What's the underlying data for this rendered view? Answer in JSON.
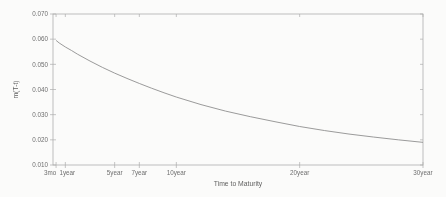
{
  "figure": {
    "background": "#fbfbfa",
    "appearance": "scanned grayscale plot"
  },
  "chart_data": {
    "type": "line",
    "title": "",
    "xlabel": "Time to Maturity",
    "ylabel": "m(T-t)",
    "xlim": [
      0,
      30
    ],
    "ylim": [
      0.01,
      0.07
    ],
    "grid": false,
    "legend": null,
    "axis_color": "#aeaeae",
    "text_color": "#6f6f6f",
    "x_ticks": [
      {
        "value": 0.25,
        "label": "3mo"
      },
      {
        "value": 1,
        "label": "1year"
      },
      {
        "value": 5,
        "label": "5year"
      },
      {
        "value": 7,
        "label": "7year"
      },
      {
        "value": 10,
        "label": "10year"
      },
      {
        "value": 20,
        "label": "20year"
      },
      {
        "value": 30,
        "label": "30year"
      }
    ],
    "y_ticks": [
      {
        "value": 0.01,
        "label": "0.010"
      },
      {
        "value": 0.02,
        "label": "0.020"
      },
      {
        "value": 0.03,
        "label": "0.030"
      },
      {
        "value": 0.04,
        "label": "0.040"
      },
      {
        "value": 0.05,
        "label": "0.050"
      },
      {
        "value": 0.06,
        "label": "0.060"
      },
      {
        "value": 0.07,
        "label": "0.070"
      }
    ],
    "series": [
      {
        "name": "zero-coupon yield m(T-t)",
        "color": "#8f8f8f",
        "x": [
          0.25,
          0.5,
          1,
          1.5,
          2,
          3,
          4,
          5,
          6,
          7,
          8,
          9,
          10,
          12,
          14,
          16,
          18,
          20,
          22,
          24,
          26,
          28,
          30
        ],
        "values": [
          0.0595,
          0.0585,
          0.0569,
          0.0555,
          0.054,
          0.0513,
          0.0488,
          0.0465,
          0.0444,
          0.0424,
          0.0405,
          0.0387,
          0.037,
          0.034,
          0.0314,
          0.0292,
          0.0272,
          0.0253,
          0.0237,
          0.0223,
          0.0211,
          0.02,
          0.019
        ]
      }
    ]
  }
}
